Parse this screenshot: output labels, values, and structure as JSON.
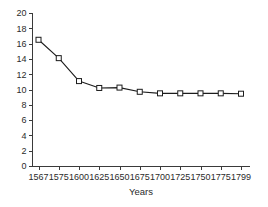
{
  "chart_data": {
    "type": "line",
    "title": "",
    "xlabel": "Years",
    "ylabel": "",
    "categories": [
      "1567",
      "1575",
      "1600",
      "1625",
      "1650",
      "1675",
      "1700",
      "1725",
      "1750",
      "1775",
      "1799"
    ],
    "values": [
      16.5,
      14.1,
      11.1,
      10.2,
      10.25,
      9.7,
      9.5,
      9.5,
      9.5,
      9.5,
      9.45
    ],
    "ylim": [
      0,
      20
    ],
    "yticks": [
      0,
      2,
      4,
      6,
      8,
      10,
      12,
      14,
      16,
      18,
      20
    ],
    "ytick_labels": [
      "0",
      "2",
      "4",
      "6",
      "8",
      "10",
      "12",
      "14",
      "16",
      "18",
      "20"
    ],
    "grid": false,
    "legend": false,
    "legend_position": "none",
    "marker": "open-square",
    "line_color": "#1c1c1c",
    "marker_fill": "#ffffff",
    "marker_edge_color": "#1c1c1c",
    "axis_color": "#3a3a3a",
    "background_color": "#ffffff"
  }
}
